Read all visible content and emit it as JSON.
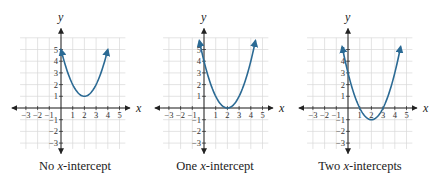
{
  "chart_data": [
    {
      "type": "line",
      "title": "No x-intercept",
      "caption": "No x-intercept",
      "caption_prefix": "No ",
      "caption_var": "x",
      "caption_suffix": "-intercept",
      "function": "y = (x - 2)^2 + 1",
      "vertex": [
        2,
        1
      ],
      "x_intercepts": [],
      "y_intercept": 5,
      "x": [
        0,
        0.5,
        1,
        1.5,
        2,
        2.5,
        3,
        3.5,
        4
      ],
      "y": [
        5,
        3.25,
        2,
        1.25,
        1,
        1.25,
        2,
        3.25,
        5
      ],
      "xlabel": "x",
      "ylabel": "y",
      "xlim": [
        -3,
        5
      ],
      "ylim": [
        -3,
        5
      ],
      "x_ticks": [
        -3,
        -2,
        -1,
        1,
        2,
        3,
        4,
        5
      ],
      "y_ticks": [
        -3,
        -2,
        -1,
        1,
        2,
        3,
        4,
        5
      ],
      "grid": true,
      "curve_color": "#2b6a94"
    },
    {
      "type": "line",
      "title": "One x-intercept",
      "caption": "One x-intercept",
      "caption_prefix": "One ",
      "caption_var": "x",
      "caption_suffix": "-intercept",
      "function": "y = (x - 2)^2",
      "vertex": [
        2,
        0
      ],
      "x_intercepts": [
        2
      ],
      "y_intercept": 4,
      "x": [
        -0.4,
        0,
        0.5,
        1,
        1.5,
        2,
        2.5,
        3,
        3.5,
        4,
        4.4
      ],
      "y": [
        5.76,
        4,
        2.25,
        1,
        0.25,
        0,
        0.25,
        1,
        2.25,
        4,
        5.76
      ],
      "xlabel": "x",
      "ylabel": "y",
      "xlim": [
        -3,
        5
      ],
      "ylim": [
        -3,
        5
      ],
      "x_ticks": [
        -3,
        -2,
        -1,
        1,
        2,
        3,
        4,
        5
      ],
      "y_ticks": [
        -3,
        -2,
        -1,
        1,
        2,
        3,
        4,
        5
      ],
      "grid": true,
      "curve_color": "#2b6a94"
    },
    {
      "type": "line",
      "title": "Two x-intercepts",
      "caption": "Two x-intercepts",
      "caption_prefix": "Two ",
      "caption_var": "x",
      "caption_suffix": "-intercepts",
      "function": "y = (x - 2)^2 - 1",
      "vertex": [
        2,
        -1
      ],
      "x_intercepts": [
        1,
        3
      ],
      "y_intercept": 3,
      "x": [
        -0.5,
        0,
        0.5,
        1,
        1.5,
        2,
        2.5,
        3,
        3.5,
        4,
        4.5
      ],
      "y": [
        5.25,
        3,
        1.25,
        0,
        -0.75,
        -1,
        -0.75,
        0,
        1.25,
        3,
        5.25
      ],
      "xlabel": "x",
      "ylabel": "y",
      "xlim": [
        -3,
        5
      ],
      "ylim": [
        -3,
        5
      ],
      "x_ticks": [
        -3,
        -2,
        -1,
        1,
        2,
        3,
        4,
        5
      ],
      "y_ticks": [
        -3,
        -2,
        -1,
        1,
        2,
        3,
        4,
        5
      ],
      "grid": true,
      "curve_color": "#2b6a94"
    }
  ],
  "axis_color": "#222222",
  "grid_color": "#d9d9d9",
  "tick_labels": {
    "x": [
      "−3",
      "−2",
      "−1",
      "1",
      "2",
      "3",
      "4",
      "5"
    ],
    "y": [
      "−3",
      "−2",
      "−1",
      "1",
      "2",
      "3",
      "4",
      "5"
    ]
  },
  "layout": {
    "origins": [
      [
        61,
        108
      ],
      [
        204,
        108
      ],
      [
        348,
        108
      ]
    ],
    "unit_px": 11.7
  }
}
